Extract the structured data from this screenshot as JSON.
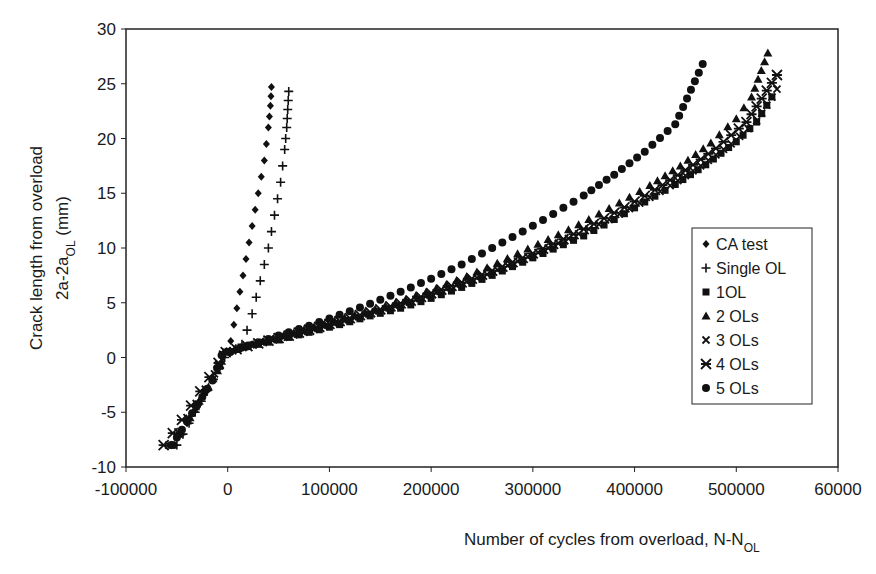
{
  "chart_data": {
    "type": "scatter",
    "title": "",
    "xlabel": "Number of cycles from overload, N-N",
    "xlabel_sub": "OL",
    "ylabel_line1": "Crack length from overload",
    "ylabel_line2_main": "2a-2a",
    "ylabel_line2_sub": "OL",
    "ylabel_line2_unit": " (mm)",
    "xlim": [
      -100000,
      600000
    ],
    "ylim": [
      -10,
      30
    ],
    "xticks": [
      -100000,
      0,
      100000,
      200000,
      300000,
      400000,
      500000,
      600000
    ],
    "xtick_labels": [
      "-100000",
      "0",
      "100000",
      "200000",
      "300000",
      "400000",
      "500000",
      "60000"
    ],
    "yticks": [
      -10,
      -5,
      0,
      5,
      10,
      15,
      20,
      25,
      30
    ],
    "ytick_labels": [
      "-10",
      "-5",
      "0",
      "5",
      "10",
      "15",
      "20",
      "25",
      "30"
    ],
    "grid": false,
    "legend_position": "right",
    "series": [
      {
        "name": "CA test",
        "marker": "diamond",
        "x": [
          -52000,
          -46000,
          -40000,
          -34000,
          -28000,
          -22000,
          -16000,
          -10000,
          -5000,
          -1000,
          3000,
          6000,
          9000,
          12000,
          15000,
          18000,
          21000,
          24000,
          27000,
          30000,
          33000,
          36000,
          38000,
          40000,
          42000,
          43000
        ],
        "y": [
          -8,
          -7,
          -6,
          -5,
          -4,
          -3,
          -2,
          -1,
          0,
          0.6,
          1.5,
          3,
          4.5,
          6,
          7.5,
          9,
          10.5,
          12,
          13.5,
          15,
          16.5,
          18,
          19.5,
          21,
          23,
          24.7
        ]
      },
      {
        "name": "Single OL",
        "marker": "plus",
        "x": [
          -50000,
          -44000,
          -38000,
          -32000,
          -26000,
          -20000,
          -14000,
          -8000,
          -3000,
          2000,
          8000,
          14000,
          19000,
          24000,
          28000,
          32000,
          36000,
          40000,
          43000,
          46000,
          49000,
          52000,
          54000,
          56000,
          58000,
          60000
        ],
        "y": [
          -8,
          -7,
          -6,
          -5,
          -4,
          -3,
          -2,
          -1,
          0,
          0.5,
          0.8,
          1.2,
          2.5,
          4,
          5.5,
          7,
          8.5,
          10,
          11.5,
          13,
          14.5,
          16,
          17.5,
          19,
          21,
          24.3
        ]
      },
      {
        "name": "1OL",
        "marker": "square",
        "x": [
          -55000,
          -47000,
          -39000,
          -31000,
          -23000,
          -15000,
          -8000,
          -2000,
          20000,
          50000,
          80000,
          110000,
          140000,
          170000,
          200000,
          230000,
          260000,
          290000,
          320000,
          350000,
          380000,
          410000,
          440000,
          470000,
          500000,
          520000,
          535000
        ],
        "y": [
          -8,
          -7,
          -5.8,
          -4.5,
          -3.2,
          -2,
          -0.8,
          0.5,
          1,
          1.6,
          2.3,
          3,
          3.8,
          4.5,
          5.4,
          6.4,
          7.5,
          8.7,
          9.9,
          11.1,
          12.6,
          14.2,
          15.8,
          17.6,
          19.7,
          21.5,
          23.8
        ]
      },
      {
        "name": "2 OLs",
        "marker": "triangle",
        "x": [
          -55000,
          -46000,
          -37000,
          -28000,
          -19000,
          -10000,
          -2000,
          25000,
          55000,
          85000,
          115000,
          145000,
          175000,
          205000,
          235000,
          265000,
          295000,
          325000,
          355000,
          385000,
          415000,
          445000,
          475000,
          500000,
          515000,
          531000
        ],
        "y": [
          -8,
          -6.8,
          -5.5,
          -4,
          -2.7,
          -1.2,
          0.5,
          1.2,
          2,
          2.8,
          3.6,
          4.4,
          5.3,
          6.3,
          7.4,
          8.6,
          9.9,
          11.2,
          12.6,
          14.1,
          15.7,
          17.5,
          19.6,
          21.8,
          23.8,
          27.8
        ]
      },
      {
        "name": "3 OLs",
        "marker": "x",
        "x": [
          -58000,
          -49000,
          -40000,
          -31000,
          -22000,
          -13000,
          -5000,
          15000,
          45000,
          75000,
          105000,
          135000,
          165000,
          195000,
          225000,
          255000,
          285000,
          315000,
          345000,
          375000,
          405000,
          435000,
          465000,
          495000,
          520000,
          540000
        ],
        "y": [
          -8,
          -6.8,
          -5.5,
          -4.2,
          -2.9,
          -1.5,
          0.3,
          0.9,
          1.6,
          2.3,
          3.1,
          3.9,
          4.7,
          5.6,
          6.6,
          7.6,
          8.8,
          10,
          11.3,
          12.6,
          14.1,
          15.7,
          17.5,
          19.5,
          21.6,
          24.5
        ]
      },
      {
        "name": "4 OLs",
        "marker": "asterisk",
        "x": [
          -63000,
          -54000,
          -45000,
          -36000,
          -27000,
          -18000,
          -9000,
          -2000,
          30000,
          60000,
          90000,
          120000,
          150000,
          180000,
          210000,
          240000,
          270000,
          300000,
          330000,
          360000,
          390000,
          420000,
          450000,
          480000,
          510000,
          540000
        ],
        "y": [
          -8,
          -6.9,
          -5.7,
          -4.4,
          -3.1,
          -1.8,
          -0.5,
          0.5,
          1.3,
          2,
          2.8,
          3.6,
          4.4,
          5.2,
          6.2,
          7.2,
          8.3,
          9.5,
          10.8,
          12.2,
          13.7,
          15.3,
          17.1,
          19.1,
          21.5,
          25.8
        ]
      },
      {
        "name": "5 OLs",
        "marker": "circle",
        "x": [
          -55000,
          -45000,
          -35000,
          -25000,
          -15000,
          -6000,
          20000,
          50000,
          80000,
          110000,
          140000,
          170000,
          200000,
          230000,
          260000,
          290000,
          320000,
          350000,
          380000,
          410000,
          440000,
          467000
        ],
        "y": [
          -8,
          -6.6,
          -5.1,
          -3.6,
          -2.1,
          0.2,
          1.1,
          2,
          2.9,
          3.9,
          4.9,
          6,
          7.2,
          8.5,
          10,
          11.5,
          13.1,
          14.8,
          16.7,
          18.8,
          21.3,
          26.8
        ]
      }
    ]
  }
}
